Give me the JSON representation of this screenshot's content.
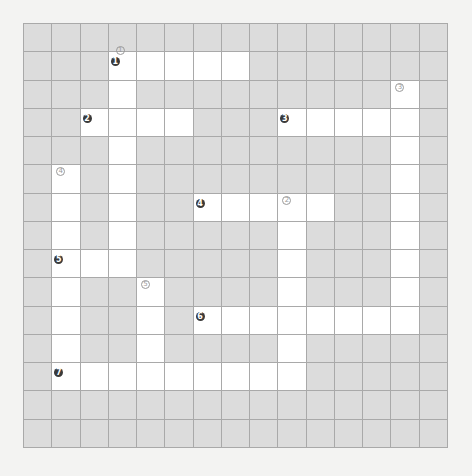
{
  "puzzle": {
    "type": "crossword",
    "rows": 15,
    "cols": 15,
    "colors": {
      "background": "#f3f3f2",
      "blocked": "#dcdcdc",
      "open": "#ffffff",
      "line": "#a9a9a9",
      "across_marker": "#3a3a3a",
      "down_marker": "#9a9a9a"
    },
    "white_cells": {
      "1": [
        3,
        4,
        5,
        6,
        7
      ],
      "2": [
        3,
        13
      ],
      "3": [
        2,
        3,
        4,
        5,
        9,
        10,
        11,
        12,
        13
      ],
      "4": [
        3,
        13
      ],
      "5": [
        1,
        3,
        13
      ],
      "6": [
        1,
        3,
        6,
        7,
        8,
        9,
        10,
        13
      ],
      "7": [
        1,
        3,
        9,
        13
      ],
      "8": [
        1,
        2,
        3,
        9,
        13
      ],
      "9": [
        1,
        4,
        9,
        13
      ],
      "10": [
        1,
        4,
        6,
        7,
        8,
        9,
        10,
        11,
        12,
        13
      ],
      "11": [
        1,
        4,
        9
      ],
      "12": [
        1,
        2,
        3,
        4,
        5,
        6,
        7,
        8,
        9
      ]
    },
    "across_markers": [
      {
        "label": "1",
        "row": 1,
        "col": 3
      },
      {
        "label": "2",
        "row": 3,
        "col": 2
      },
      {
        "label": "3",
        "row": 3,
        "col": 9
      },
      {
        "label": "4",
        "row": 6,
        "col": 6
      },
      {
        "label": "5",
        "row": 8,
        "col": 1
      },
      {
        "label": "6",
        "row": 10,
        "col": 6
      },
      {
        "label": "7",
        "row": 12,
        "col": 1
      }
    ],
    "down_markers": [
      {
        "label": "1",
        "row": 1,
        "col": 3
      },
      {
        "label": "2",
        "row": 6,
        "col": 9
      },
      {
        "label": "3",
        "row": 2,
        "col": 13
      },
      {
        "label": "4",
        "row": 5,
        "col": 1
      },
      {
        "label": "5",
        "row": 9,
        "col": 4
      }
    ]
  }
}
